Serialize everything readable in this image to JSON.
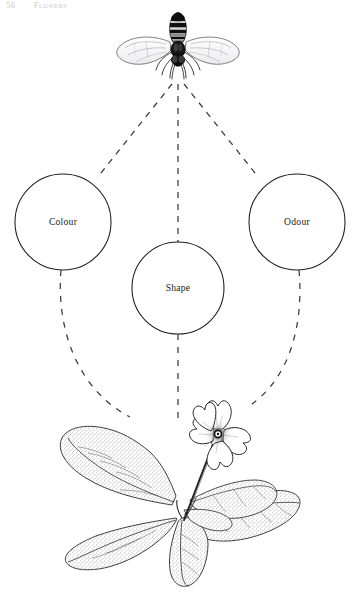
{
  "page": {
    "folio": "56",
    "running_title": "Flowers",
    "background_color": "#ffffff",
    "ink_color": "#1a1a1a"
  },
  "figure": {
    "caption": "",
    "pollinator": {
      "name": "hoverfly",
      "label": ""
    },
    "target": {
      "name": "primrose-plant",
      "label": ""
    },
    "nodes": [
      {
        "id": "colour",
        "label": "Colour",
        "cx": 63,
        "cy": 222,
        "r": 48
      },
      {
        "id": "shape",
        "label": "Shape",
        "cx": 178,
        "cy": 288,
        "r": 46
      },
      {
        "id": "odour",
        "label": "Odour",
        "cx": 297,
        "cy": 222,
        "r": 48
      }
    ],
    "links": {
      "upper": [
        {
          "from": "pollinator",
          "to": "colour"
        },
        {
          "from": "pollinator",
          "to": "shape"
        },
        {
          "from": "pollinator",
          "to": "odour"
        }
      ],
      "lower": [
        {
          "from": "colour",
          "to": "target"
        },
        {
          "from": "shape",
          "to": "target"
        },
        {
          "from": "odour",
          "to": "target"
        }
      ],
      "style": "dashed",
      "stroke": "#3a3640"
    }
  }
}
